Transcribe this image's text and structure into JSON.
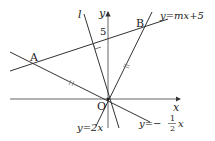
{
  "diagram": {
    "type": "coordinate-geometry",
    "axes": {
      "x_label": "x",
      "y_label": "y",
      "origin_label": "O"
    },
    "lines": [
      {
        "id": "line-mx5",
        "label": "y=mx+5",
        "equation": "y = mx + 5"
      },
      {
        "id": "line-2x",
        "label": "y=2x",
        "equation": "y = 2x"
      },
      {
        "id": "line-half",
        "label_prefix": "y=−",
        "frac_num": "1",
        "frac_den": "2",
        "label_suffix": "x",
        "equation": "y = -1/2 x"
      },
      {
        "id": "line-l",
        "label": "l"
      }
    ],
    "points": [
      {
        "id": "A",
        "label": "A"
      },
      {
        "id": "B",
        "label": "B"
      }
    ],
    "y_intercept_label": "5",
    "annotations": {
      "right_angle": "l ⟂ (y=mx+5)",
      "equal_marks": "OA = OB"
    },
    "colors": {
      "stroke": "#333333",
      "axis": "#555555",
      "text": "#222222"
    }
  }
}
